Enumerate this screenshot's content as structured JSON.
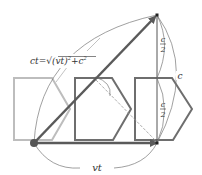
{
  "diagram": {
    "labels": {
      "hypotenuse": "ct=√(vt)²+c²",
      "hyp_ct": "ct",
      "hyp_eq": "=",
      "hyp_sqrt": "√",
      "hyp_inner": "(vt)",
      "hyp_sup": "2",
      "hyp_plus": "+c",
      "hyp_sup2": "2",
      "base": "vt",
      "half_top_num": "c",
      "half_top_den": "2",
      "half_bottom_num": "c",
      "half_bottom_den": "2",
      "height": "c"
    },
    "colors": {
      "faded_clock": "#bdbdbd",
      "clock": "#6e6e6e",
      "arrow": "#5a5a5a",
      "thin_line": "#777777",
      "dashed": "#999999"
    }
  }
}
